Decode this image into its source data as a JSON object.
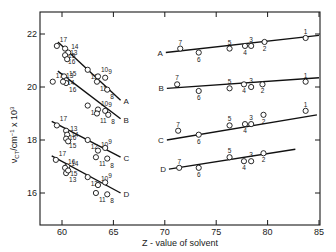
{
  "chart_data": {
    "type": "scatter",
    "title": "",
    "xlabel": "Z-value of solvent",
    "ylabel": "ν_CT / cm⁻¹ × 10³",
    "xlim": [
      58,
      85
    ],
    "ylim": [
      15.8,
      22.7
    ],
    "x_ticks": [
      60,
      65,
      70,
      75,
      80,
      85
    ],
    "y_ticks": [
      16,
      18,
      20,
      22
    ],
    "grid": false,
    "legend": "none (series labelled A–D directly at line ends)",
    "panels": [
      {
        "name": "left",
        "description": "Alcohol solvents 8–17, Z ≈ 59–66",
        "series": [
          {
            "name": "A",
            "line": [
              [
                59.6,
                21.7
              ],
              [
                65.7,
                19.5
              ]
            ],
            "points": [
              {
                "label": "17",
                "z": 59.5,
                "v": 21.55
              },
              {
                "label": "15",
                "z": 60.3,
                "v": 21.45
              },
              {
                "label": "14",
                "z": 60.6,
                "v": 21.3
              },
              {
                "label": "16",
                "z": 60.3,
                "v": 21.2
              },
              {
                "label": "13",
                "z": 60.5,
                "v": 21.05
              },
              {
                "label": "12",
                "z": 62.5,
                "v": 20.65
              },
              {
                "label": "10",
                "z": 63.5,
                "v": 20.4
              },
              {
                "label": "11",
                "z": 63.4,
                "v": 20.2
              },
              {
                "label": "9",
                "z": 64.2,
                "v": 20.35
              },
              {
                "label": "8",
                "z": 64.4,
                "v": 19.9
              }
            ]
          },
          {
            "name": "B",
            "line": [
              [
                59.6,
                20.6
              ],
              [
                65.7,
                18.8
              ]
            ],
            "points": [
              {
                "label": "17",
                "z": 59.1,
                "v": 20.2
              },
              {
                "label": "14",
                "z": 60.2,
                "v": 20.4
              },
              {
                "label": "15",
                "z": 60.4,
                "v": 20.25
              },
              {
                "label": "16",
                "z": 60.4,
                "v": 20.15
              },
              {
                "label": "13",
                "z": 60.1,
                "v": 20.2
              },
              {
                "label": "12",
                "z": 62.5,
                "v": 19.3
              },
              {
                "label": "10",
                "z": 63.5,
                "v": 19.15
              },
              {
                "label": "11",
                "z": 63.4,
                "v": 19.0
              },
              {
                "label": "9",
                "z": 64.2,
                "v": 19.1
              },
              {
                "label": "8",
                "z": 64.5,
                "v": 18.95
              }
            ]
          },
          {
            "name": "C",
            "line": [
              [
                59.0,
                18.7
              ],
              [
                65.7,
                17.35
              ]
            ],
            "points": [
              {
                "label": "17",
                "z": 59.5,
                "v": 18.55
              },
              {
                "label": "16",
                "z": 60.4,
                "v": 18.35
              },
              {
                "label": "13",
                "z": 60.5,
                "v": 18.2
              },
              {
                "label": "15",
                "z": 60.4,
                "v": 18.05
              },
              {
                "label": "14",
                "z": 60.6,
                "v": 17.95
              },
              {
                "label": "12",
                "z": 62.5,
                "v": 18.0
              },
              {
                "label": "10",
                "z": 63.5,
                "v": 17.6
              },
              {
                "label": "11",
                "z": 63.3,
                "v": 17.35
              },
              {
                "label": "9",
                "z": 64.2,
                "v": 17.7
              },
              {
                "label": "8",
                "z": 64.4,
                "v": 17.3
              }
            ]
          },
          {
            "name": "D",
            "line": [
              [
                59.0,
                17.4
              ],
              [
                65.7,
                16.0
              ]
            ],
            "points": [
              {
                "label": "17",
                "z": 59.4,
                "v": 17.25
              },
              {
                "label": "15",
                "z": 60.5,
                "v": 17.0
              },
              {
                "label": "16",
                "z": 60.3,
                "v": 16.95
              },
              {
                "label": "13",
                "z": 60.4,
                "v": 16.75
              },
              {
                "label": "14",
                "z": 60.6,
                "v": 16.85
              },
              {
                "label": "12",
                "z": 62.5,
                "v": 16.6
              },
              {
                "label": "10",
                "z": 63.5,
                "v": 16.3
              },
              {
                "label": "11",
                "z": 63.3,
                "v": 16.0
              },
              {
                "label": "9",
                "z": 64.2,
                "v": 16.4
              },
              {
                "label": "8",
                "z": 64.4,
                "v": 15.95
              }
            ]
          }
        ]
      },
      {
        "name": "right",
        "description": "Solvents 1–7, Z ≈ 71–84",
        "series": [
          {
            "name": "A",
            "line": [
              [
                70.1,
                21.3
              ],
              [
                85.0,
                21.95
              ]
            ],
            "points": [
              {
                "label": "7",
                "z": 71.5,
                "v": 21.45
              },
              {
                "label": "6",
                "z": 73.3,
                "v": 21.3
              },
              {
                "label": "5",
                "z": 76.3,
                "v": 21.45
              },
              {
                "label": "4",
                "z": 77.8,
                "v": 21.55
              },
              {
                "label": "3",
                "z": 78.4,
                "v": 21.55
              },
              {
                "label": "2",
                "z": 79.7,
                "v": 21.7
              },
              {
                "label": "1",
                "z": 83.7,
                "v": 21.85
              }
            ]
          },
          {
            "name": "B",
            "line": [
              [
                70.2,
                19.95
              ],
              [
                85.0,
                20.35
              ]
            ],
            "points": [
              {
                "label": "7",
                "z": 71.2,
                "v": 20.1
              },
              {
                "label": "6",
                "z": 73.3,
                "v": 19.85
              },
              {
                "label": "5",
                "z": 76.3,
                "v": 19.95
              },
              {
                "label": "4",
                "z": 77.7,
                "v": 20.1
              },
              {
                "label": "3",
                "z": 78.4,
                "v": 20.0
              },
              {
                "label": "2",
                "z": 79.5,
                "v": 20.1
              },
              {
                "label": "1",
                "z": 83.7,
                "v": 20.2
              }
            ]
          },
          {
            "name": "C",
            "line": [
              [
                70.2,
                18.0
              ],
              [
                84.8,
                18.95
              ]
            ],
            "points": [
              {
                "label": "7",
                "z": 71.3,
                "v": 18.35
              },
              {
                "label": "6",
                "z": 73.3,
                "v": 18.2
              },
              {
                "label": "5",
                "z": 76.3,
                "v": 18.55
              },
              {
                "label": "4",
                "z": 77.8,
                "v": 18.6
              },
              {
                "label": "3",
                "z": 78.4,
                "v": 18.6
              },
              {
                "label": "2",
                "z": 79.6,
                "v": 18.95
              },
              {
                "label": "1",
                "z": 83.7,
                "v": 19.1
              }
            ]
          },
          {
            "name": "D",
            "line": [
              [
                70.4,
                16.9
              ],
              [
                82.7,
                17.65
              ]
            ],
            "points": [
              {
                "label": "7",
                "z": 71.4,
                "v": 16.95
              },
              {
                "label": "6",
                "z": 73.3,
                "v": 16.95
              },
              {
                "label": "5",
                "z": 76.3,
                "v": 17.35
              },
              {
                "label": "4",
                "z": 77.7,
                "v": 17.2
              },
              {
                "label": "3",
                "z": 78.4,
                "v": 17.2
              },
              {
                "label": "2",
                "z": 79.6,
                "v": 17.5
              }
            ]
          }
        ]
      }
    ]
  },
  "axes": {
    "xlabel": "Z - value of solvent",
    "ylabel_main": "ν",
    "ylabel_sub": "CT",
    "ylabel_rest": "/cm",
    "ylabel_exp": "−1",
    "ylabel_tail": " x 10",
    "ylabel_exp2": "3",
    "x_tick_labels": [
      "60",
      "65",
      "70",
      "75",
      "80",
      "85"
    ],
    "y_tick_labels": [
      "22",
      "20",
      "18",
      "16"
    ]
  },
  "series_labels": {
    "A": "A",
    "B": "B",
    "C": "C",
    "D": "D"
  }
}
